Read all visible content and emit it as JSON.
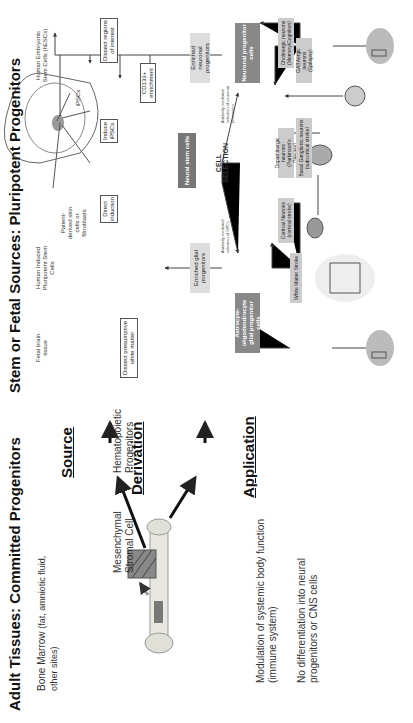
{
  "adult": {
    "title": "Adult Tissues: Committed Progenitors",
    "source_text": "Bone Marrow",
    "source_note": "(fat, amniotic fluid, other sites)",
    "derivation": [
      "Mesenchymal Stromal Cell",
      "Hematopoietic Progenitors"
    ],
    "application_1": "Modulation of systemic body function (immune system)",
    "application_2": "No differentiation into neural progenitors or CNS cells"
  },
  "rows": {
    "source": "Source",
    "derivation": "Derivation",
    "application": "Application"
  },
  "pluri": {
    "title": "Stem or Fetal Sources: Pluripotent Progenitors",
    "sources": {
      "fetal_left": "Fetal brain tissue",
      "hipsc": "Human Induced Pluripotent Stem Cells",
      "patient": "Patient-derived skin cells or fibroblasts",
      "ipsc": "iPSCs",
      "hesc": "Human Embryonic Stem Cells (hESCs)",
      "fetal_right": "Fetal brain tissue"
    },
    "boxes": {
      "dissect_white": "Dissect presumptive white matter",
      "direct_induction": "Direct induction",
      "induce_ipscs": "Induce iPSCs",
      "dissect_regions": "Dissect regions of interest",
      "cd133": "CD133+ enrichment",
      "neural_stem": "Neural stem cells",
      "enriched_glial": "Enriched glial progenitors",
      "enriched_neuronal": "Enriched neuronal progenitors",
      "cell_selection": "CELL SELECTION",
      "antibody_opc": "Antibody-mediated selection of OPCs",
      "antibody_neural": "Antibody-mediated selection of neuronal precursors",
      "astrocyte": "Astrocyte-oligodendrocyte glial progenitor cells",
      "neuronal_prog": "Neuronal progenitor cells"
    },
    "applications": {
      "white_matter": "White Matter Stroke",
      "cortical": "Cortical Neurons",
      "cortical_sub": "(cortical stroke)",
      "dopaminergic": "Dopaminergic neurons",
      "dopaminergic_sub": "(Parkinson's Disease)",
      "basal": "Basal Ganglionic neurons",
      "basal_sub": "(subcortical stroke)",
      "gabaergic": "GABAergic neurons",
      "gabaergic_sub": "(Epilepsy)",
      "cholinergic": "Cholinergic neurons",
      "cholinergic_sub": "(Memory/Cognition)"
    }
  }
}
